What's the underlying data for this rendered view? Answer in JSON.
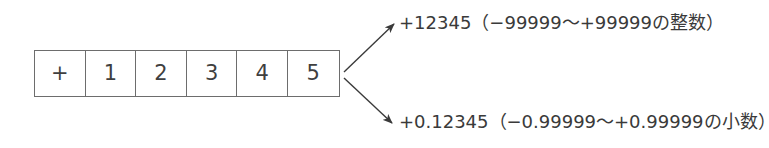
{
  "diagram": {
    "colors": {
      "background": "#ffffff",
      "border": "#6d6d6d",
      "text": "#3a3a3a",
      "arrow": "#3a3a3a"
    },
    "register": {
      "name": "signed-digit-register",
      "cells": [
        {
          "label": "+",
          "role": "sign"
        },
        {
          "label": "1",
          "role": "digit"
        },
        {
          "label": "2",
          "role": "digit"
        },
        {
          "label": "3",
          "role": "digit"
        },
        {
          "label": "4",
          "role": "digit"
        },
        {
          "label": "5",
          "role": "digit"
        }
      ]
    },
    "annotations": [
      {
        "id": "integer-interpretation",
        "text": "+12345（−99999〜+99999の整数）",
        "value": "+12345",
        "range_min": "−99999",
        "range_max": "+99999",
        "kind": "整数"
      },
      {
        "id": "fraction-interpretation",
        "text": "+0.12345（−0.99999〜+0.99999の小数）",
        "value": "+0.12345",
        "range_min": "−0.99999",
        "range_max": "+0.99999",
        "kind": "小数"
      }
    ]
  }
}
